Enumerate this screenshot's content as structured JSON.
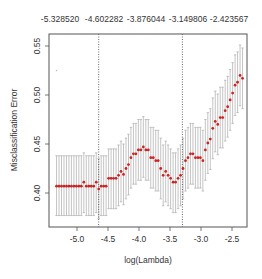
{
  "chart_data": {
    "type": "scatter",
    "title": "",
    "xlabel": "log(Lambda)",
    "ylabel": "Misclassification Error",
    "xlim": [
      -5.45,
      -2.25
    ],
    "ylim": [
      0.365,
      0.562
    ],
    "grid": false,
    "legend": null,
    "x_ticks": [
      -5.0,
      -4.5,
      -4.0,
      -3.5,
      -3.0,
      -2.5
    ],
    "x_tick_labels": [
      "-5.0",
      "-4.5",
      "-4.0",
      "-3.5",
      "-3.0",
      "-2.5"
    ],
    "y_ticks": [
      0.4,
      0.45,
      0.5,
      0.55
    ],
    "y_tick_labels": [
      "0.40",
      "0.45",
      "0.50",
      "0.55"
    ],
    "top_axis_labels": [
      "-5.328520",
      "-4.602282",
      "-3.876044",
      "-3.149806",
      "-2.423567"
    ],
    "top_axis_positions": [
      -5.32852,
      -4.602282,
      -3.876044,
      -3.149806,
      -2.423567
    ],
    "vlines": [
      {
        "x": -4.65,
        "style": "dotted",
        "label": "lambda.min"
      },
      {
        "x": -3.3,
        "style": "dotted",
        "label": "lambda.1se"
      }
    ],
    "outlier_point": {
      "x": -5.33,
      "y": 0.525
    },
    "series": [
      {
        "name": "cv error",
        "color": "#cc2222",
        "errorbar_color": "#aaaaaa",
        "points": [
          {
            "x": -5.33,
            "y": 0.407,
            "lo": 0.377,
            "hi": 0.438
          },
          {
            "x": -5.29,
            "y": 0.407,
            "lo": 0.377,
            "hi": 0.438
          },
          {
            "x": -5.25,
            "y": 0.407,
            "lo": 0.377,
            "hi": 0.438
          },
          {
            "x": -5.21,
            "y": 0.407,
            "lo": 0.377,
            "hi": 0.438
          },
          {
            "x": -5.17,
            "y": 0.407,
            "lo": 0.377,
            "hi": 0.438
          },
          {
            "x": -5.13,
            "y": 0.407,
            "lo": 0.377,
            "hi": 0.438
          },
          {
            "x": -5.09,
            "y": 0.407,
            "lo": 0.377,
            "hi": 0.438
          },
          {
            "x": -5.05,
            "y": 0.407,
            "lo": 0.377,
            "hi": 0.438
          },
          {
            "x": -5.01,
            "y": 0.407,
            "lo": 0.377,
            "hi": 0.438
          },
          {
            "x": -4.97,
            "y": 0.407,
            "lo": 0.377,
            "hi": 0.438
          },
          {
            "x": -4.93,
            "y": 0.407,
            "lo": 0.377,
            "hi": 0.438
          },
          {
            "x": -4.89,
            "y": 0.411,
            "lo": 0.38,
            "hi": 0.441
          },
          {
            "x": -4.85,
            "y": 0.407,
            "lo": 0.377,
            "hi": 0.438
          },
          {
            "x": -4.81,
            "y": 0.407,
            "lo": 0.377,
            "hi": 0.438
          },
          {
            "x": -4.77,
            "y": 0.407,
            "lo": 0.377,
            "hi": 0.438
          },
          {
            "x": -4.73,
            "y": 0.407,
            "lo": 0.377,
            "hi": 0.438
          },
          {
            "x": -4.69,
            "y": 0.411,
            "lo": 0.38,
            "hi": 0.441
          },
          {
            "x": -4.65,
            "y": 0.404,
            "lo": 0.374,
            "hi": 0.435
          },
          {
            "x": -4.61,
            "y": 0.407,
            "lo": 0.377,
            "hi": 0.438
          },
          {
            "x": -4.57,
            "y": 0.407,
            "lo": 0.377,
            "hi": 0.438
          },
          {
            "x": -4.53,
            "y": 0.407,
            "lo": 0.377,
            "hi": 0.438
          },
          {
            "x": -4.49,
            "y": 0.415,
            "lo": 0.384,
            "hi": 0.445
          },
          {
            "x": -4.45,
            "y": 0.415,
            "lo": 0.384,
            "hi": 0.445
          },
          {
            "x": -4.41,
            "y": 0.415,
            "lo": 0.384,
            "hi": 0.445
          },
          {
            "x": -4.37,
            "y": 0.415,
            "lo": 0.384,
            "hi": 0.445
          },
          {
            "x": -4.33,
            "y": 0.418,
            "lo": 0.387,
            "hi": 0.449
          },
          {
            "x": -4.29,
            "y": 0.422,
            "lo": 0.391,
            "hi": 0.453
          },
          {
            "x": -4.25,
            "y": 0.419,
            "lo": 0.388,
            "hi": 0.45
          },
          {
            "x": -4.21,
            "y": 0.425,
            "lo": 0.394,
            "hi": 0.456
          },
          {
            "x": -4.17,
            "y": 0.429,
            "lo": 0.398,
            "hi": 0.46
          },
          {
            "x": -4.13,
            "y": 0.436,
            "lo": 0.405,
            "hi": 0.467
          },
          {
            "x": -4.09,
            "y": 0.44,
            "lo": 0.409,
            "hi": 0.471
          },
          {
            "x": -4.05,
            "y": 0.44,
            "lo": 0.409,
            "hi": 0.471
          },
          {
            "x": -4.01,
            "y": 0.444,
            "lo": 0.413,
            "hi": 0.475
          },
          {
            "x": -3.97,
            "y": 0.444,
            "lo": 0.413,
            "hi": 0.475
          },
          {
            "x": -3.93,
            "y": 0.447,
            "lo": 0.416,
            "hi": 0.478
          },
          {
            "x": -3.89,
            "y": 0.444,
            "lo": 0.413,
            "hi": 0.475
          },
          {
            "x": -3.85,
            "y": 0.444,
            "lo": 0.413,
            "hi": 0.475
          },
          {
            "x": -3.81,
            "y": 0.436,
            "lo": 0.405,
            "hi": 0.467
          },
          {
            "x": -3.77,
            "y": 0.436,
            "lo": 0.405,
            "hi": 0.467
          },
          {
            "x": -3.73,
            "y": 0.433,
            "lo": 0.402,
            "hi": 0.464
          },
          {
            "x": -3.69,
            "y": 0.433,
            "lo": 0.402,
            "hi": 0.464
          },
          {
            "x": -3.65,
            "y": 0.425,
            "lo": 0.394,
            "hi": 0.456
          },
          {
            "x": -3.61,
            "y": 0.418,
            "lo": 0.387,
            "hi": 0.449
          },
          {
            "x": -3.57,
            "y": 0.422,
            "lo": 0.391,
            "hi": 0.453
          },
          {
            "x": -3.53,
            "y": 0.418,
            "lo": 0.387,
            "hi": 0.449
          },
          {
            "x": -3.49,
            "y": 0.415,
            "lo": 0.384,
            "hi": 0.445
          },
          {
            "x": -3.45,
            "y": 0.411,
            "lo": 0.38,
            "hi": 0.441
          },
          {
            "x": -3.41,
            "y": 0.411,
            "lo": 0.38,
            "hi": 0.441
          },
          {
            "x": -3.37,
            "y": 0.415,
            "lo": 0.384,
            "hi": 0.445
          },
          {
            "x": -3.33,
            "y": 0.418,
            "lo": 0.387,
            "hi": 0.449
          },
          {
            "x": -3.29,
            "y": 0.425,
            "lo": 0.394,
            "hi": 0.456
          },
          {
            "x": -3.25,
            "y": 0.433,
            "lo": 0.402,
            "hi": 0.464
          },
          {
            "x": -3.21,
            "y": 0.436,
            "lo": 0.405,
            "hi": 0.467
          },
          {
            "x": -3.17,
            "y": 0.44,
            "lo": 0.409,
            "hi": 0.471
          },
          {
            "x": -3.13,
            "y": 0.44,
            "lo": 0.409,
            "hi": 0.471
          },
          {
            "x": -3.09,
            "y": 0.436,
            "lo": 0.405,
            "hi": 0.467
          },
          {
            "x": -3.05,
            "y": 0.436,
            "lo": 0.405,
            "hi": 0.467
          },
          {
            "x": -3.01,
            "y": 0.436,
            "lo": 0.405,
            "hi": 0.467
          },
          {
            "x": -2.97,
            "y": 0.433,
            "lo": 0.402,
            "hi": 0.464
          },
          {
            "x": -2.93,
            "y": 0.444,
            "lo": 0.413,
            "hi": 0.475
          },
          {
            "x": -2.89,
            "y": 0.451,
            "lo": 0.42,
            "hi": 0.482
          },
          {
            "x": -2.85,
            "y": 0.455,
            "lo": 0.424,
            "hi": 0.486
          },
          {
            "x": -2.81,
            "y": 0.466,
            "lo": 0.435,
            "hi": 0.497
          },
          {
            "x": -2.77,
            "y": 0.473,
            "lo": 0.442,
            "hi": 0.504
          },
          {
            "x": -2.73,
            "y": 0.47,
            "lo": 0.439,
            "hi": 0.501
          },
          {
            "x": -2.69,
            "y": 0.477,
            "lo": 0.446,
            "hi": 0.508
          },
          {
            "x": -2.65,
            "y": 0.477,
            "lo": 0.446,
            "hi": 0.508
          },
          {
            "x": -2.61,
            "y": 0.484,
            "lo": 0.453,
            "hi": 0.515
          },
          {
            "x": -2.57,
            "y": 0.488,
            "lo": 0.457,
            "hi": 0.519
          },
          {
            "x": -2.53,
            "y": 0.495,
            "lo": 0.464,
            "hi": 0.526
          },
          {
            "x": -2.49,
            "y": 0.502,
            "lo": 0.471,
            "hi": 0.533
          },
          {
            "x": -2.45,
            "y": 0.51,
            "lo": 0.479,
            "hi": 0.541
          },
          {
            "x": -2.41,
            "y": 0.513,
            "lo": 0.482,
            "hi": 0.544
          },
          {
            "x": -2.37,
            "y": 0.52,
            "lo": 0.489,
            "hi": 0.551
          },
          {
            "x": -2.33,
            "y": 0.517,
            "lo": 0.486,
            "hi": 0.548
          }
        ]
      }
    ]
  }
}
